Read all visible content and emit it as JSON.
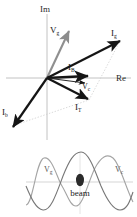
{
  "figure": {
    "colors": {
      "axis": "#b9b9b9",
      "phasor_dark": "#151515",
      "phasor_gray": "#8c8c8c",
      "dotted": "#c8c8c8",
      "wave_gray": "#9a9a9a",
      "wave_dark": "#6e6e6e",
      "text": "#1a1a1a",
      "beam_fill": "#2b2b2b",
      "background": "#ffffff"
    }
  },
  "phasor_diagram": {
    "axes": {
      "imaginary_label": "Im",
      "real_label": "Re",
      "origin": {
        "x": 47,
        "y": 78
      }
    },
    "phasors": [
      {
        "name": "V_g",
        "base": "V",
        "sub": "g",
        "angle_deg": 62,
        "length": 58,
        "style": "gray",
        "label_x": 55,
        "label_y": 34
      },
      {
        "name": "I_g",
        "base": "I",
        "sub": "g",
        "angle_deg": 27,
        "length": 83,
        "style": "dark",
        "label_x": 114,
        "label_y": 35
      },
      {
        "name": "I_B",
        "base": "I",
        "sub": "B",
        "angle_deg": 2,
        "length": 42,
        "style": "dark",
        "label_x": 72,
        "label_y": 70
      },
      {
        "name": "V_c",
        "base": "V",
        "sub": "c",
        "angle_deg": -8,
        "length": 36,
        "style": "dark",
        "label_x": 86,
        "label_y": 86
      },
      {
        "name": "I_T",
        "base": "I",
        "sub": "T",
        "angle_deg": -30,
        "length": 48,
        "style": "dark",
        "label_x": 79,
        "label_y": 108
      },
      {
        "name": "I_b",
        "base": "I",
        "sub": "b",
        "angle_deg": -133,
        "length": 62,
        "style": "dark",
        "label_x": 5,
        "label_y": 113
      }
    ],
    "construction_lines": [
      {
        "name": "dotted-parallelogram-left",
        "from": "origin-lower-left-tip",
        "to": "I_T-tip",
        "style": "dotted"
      },
      {
        "name": "dotted-parallelogram-right",
        "from": "I_T-tip",
        "to": "I_g-tip",
        "style": "dotted"
      }
    ]
  },
  "waveform_plot": {
    "baseline_label": "",
    "curves": [
      {
        "name": "V_g",
        "base": "V",
        "sub": "g",
        "label_x": 47,
        "label_y": 170,
        "style": "gray",
        "phase_shift_deg": 0
      },
      {
        "name": "V_c",
        "base": "V",
        "sub": "c",
        "label_x": 117,
        "label_y": 170,
        "style": "dark",
        "phase_shift_deg": 38
      }
    ],
    "marker": {
      "name": "beam",
      "label": "beam",
      "shape": "filled-ellipse",
      "cx": 80,
      "cy": 181,
      "rx": 4,
      "ry": 6,
      "label_x": 80,
      "label_y": 196
    }
  }
}
